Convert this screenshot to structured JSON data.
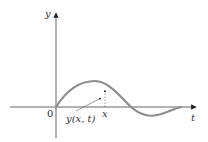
{
  "diagram": {
    "labels": {
      "y_axis": "y",
      "t_axis": "t",
      "origin": "0",
      "x_mark": "x",
      "displacement": "y(x, t)"
    },
    "colors": {
      "axis": "#333333",
      "curve": "#8c8c8c",
      "annotation": "#333333"
    }
  }
}
